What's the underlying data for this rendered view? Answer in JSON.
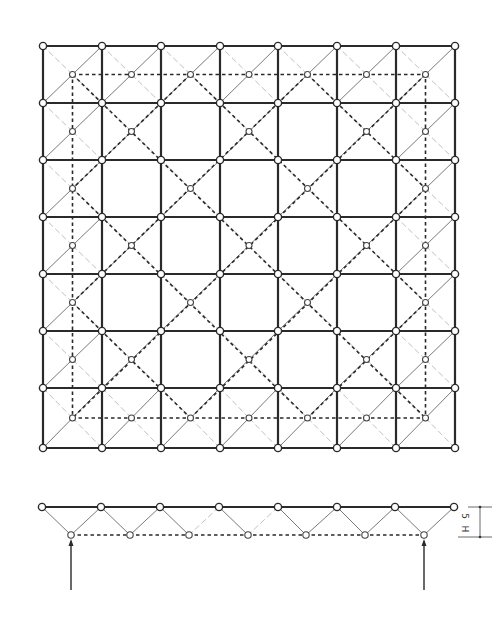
{
  "diagram": {
    "type": "space-truss",
    "plan": {
      "title": "plan view",
      "grid_cells": 7,
      "top_nodes_x": [
        43,
        102,
        161,
        220,
        278,
        337,
        396,
        455
      ],
      "top_nodes_y": [
        46,
        103,
        160,
        217,
        274,
        331,
        388,
        448
      ],
      "bottom_node_rule": "perimeter cells plus interior cells where (row+col) is even",
      "legend": {
        "top_chord": "solid thick lines",
        "bottom_chord": "dashed lines",
        "web": "thin diagonals from cell corners to bottom node"
      }
    },
    "elevation": {
      "title": "elevation view",
      "top_nodes_x": [
        42,
        101,
        160,
        219,
        278,
        337,
        395,
        454
      ],
      "top_y": 507,
      "bottom_nodes_x": [
        71,
        130,
        189,
        248,
        306,
        365,
        424
      ],
      "bottom_y": 535,
      "supports": [
        {
          "x": 71,
          "label": "support-left"
        },
        {
          "x": 424,
          "label": "support-right"
        }
      ],
      "dimension": {
        "label_top": "H",
        "label_bottom": "5",
        "text": "H/5"
      }
    }
  },
  "colors": {
    "line": "#2a2a2a",
    "web": "#6a6a6a",
    "background": "#ffffff"
  }
}
